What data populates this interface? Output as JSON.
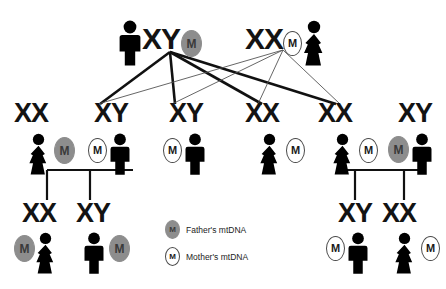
{
  "diagram": {
    "colors": {
      "father_mtdna_fill": "#8d8d8d",
      "mother_mtdna_fill": "#ffffff",
      "figure": "#000000",
      "line_thick": "#111111",
      "line_thin": "#555555",
      "background": "#ffffff"
    },
    "mtdna_marker_text": "M"
  },
  "legend": {
    "items": [
      {
        "marker": "M",
        "type": "father",
        "label": "Father's mtDNA",
        "icon": "filled-oval-m-icon"
      },
      {
        "marker": "M",
        "type": "mother",
        "label": "Mother's mtDNA",
        "icon": "outline-oval-m-icon"
      }
    ]
  },
  "generations": [
    {
      "name": "generation-1-parents",
      "people": [
        {
          "id": "g1-father",
          "sex": "male",
          "genotype": "XY",
          "mtdna": "father",
          "marker": "M",
          "icon": "male-figure-icon"
        },
        {
          "id": "g1-mother",
          "sex": "female",
          "genotype": "XX",
          "mtdna": "mother",
          "marker": "M",
          "icon": "female-figure-icon"
        }
      ]
    },
    {
      "name": "generation-2-children",
      "people": [
        {
          "id": "g2-daughter-1",
          "sex": "female",
          "genotype": "XX",
          "mtdna": "father",
          "marker": "M",
          "icon": "female-figure-icon"
        },
        {
          "id": "g2-son-1",
          "sex": "male",
          "genotype": "XY",
          "mtdna": "mother",
          "marker": "M",
          "icon": "male-figure-icon"
        },
        {
          "id": "g2-son-2",
          "sex": "male",
          "genotype": "XY",
          "mtdna": "mother",
          "marker": "M",
          "icon": "male-figure-icon"
        },
        {
          "id": "g2-daughter-2",
          "sex": "female",
          "genotype": "XX",
          "mtdna": "mother",
          "marker": "M",
          "icon": "female-figure-icon"
        },
        {
          "id": "g2-daughter-3",
          "sex": "female",
          "genotype": "XX",
          "mtdna": "mother",
          "marker": "M",
          "icon": "female-figure-icon"
        },
        {
          "id": "g2-son-3",
          "sex": "male",
          "genotype": "XY",
          "mtdna": "father",
          "marker": "M",
          "icon": "male-figure-icon"
        }
      ]
    },
    {
      "name": "generation-3-grandchildren",
      "people": [
        {
          "id": "g3-granddaughter-1",
          "sex": "female",
          "genotype": "XX",
          "mtdna": "father",
          "marker": "M",
          "icon": "female-figure-icon"
        },
        {
          "id": "g3-grandson-1",
          "sex": "male",
          "genotype": "XY",
          "mtdna": "father",
          "marker": "M",
          "icon": "male-figure-icon"
        },
        {
          "id": "g3-grandson-2",
          "sex": "male",
          "genotype": "XY",
          "mtdna": "mother",
          "marker": "M",
          "icon": "male-figure-icon"
        },
        {
          "id": "g3-granddaughter-2",
          "sex": "female",
          "genotype": "XX",
          "mtdna": "mother",
          "marker": "M",
          "icon": "female-figure-icon"
        }
      ]
    }
  ]
}
